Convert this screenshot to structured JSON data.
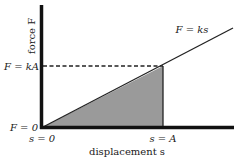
{
  "diagram": {
    "type": "force-displacement graph (Hooke's law)",
    "y_axis_label": "force F",
    "x_axis_label": "displacement s",
    "line_label": "F = ks",
    "y_tick_top": "F = kA",
    "y_tick_origin": "F = 0",
    "x_tick_origin": "s = 0",
    "x_tick_A": "s = A",
    "shaded_region": "area under line from s = 0 to s = A",
    "colors": {
      "axes": "#111111",
      "line": "#222222",
      "shade": "#9a9a9a",
      "dashed": "#222222",
      "background": "#ffffff"
    }
  }
}
